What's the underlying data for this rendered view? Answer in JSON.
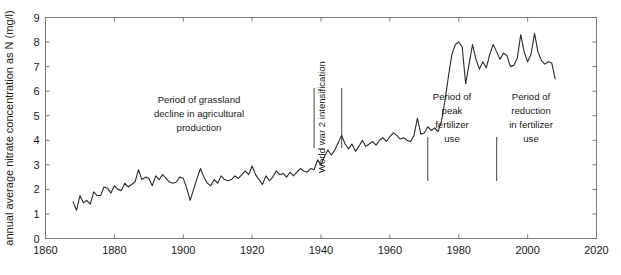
{
  "chart_data": {
    "type": "line",
    "title": "",
    "subtitle": "",
    "xlabel": "",
    "ylabel": "annual average nitrate concentration as N (mg/l)",
    "xlim": [
      1860,
      2020
    ],
    "ylim": [
      0,
      9
    ],
    "xticks": [
      1860,
      1880,
      1900,
      1920,
      1940,
      1960,
      1980,
      2000,
      2020
    ],
    "yticks": [
      0,
      1,
      2,
      3,
      4,
      5,
      6,
      7,
      8,
      9
    ],
    "grid": false,
    "legend": null,
    "series": [
      {
        "name": "annual average nitrate concentration as N",
        "x": [
          1868,
          1869,
          1870,
          1871,
          1872,
          1873,
          1874,
          1875,
          1876,
          1877,
          1878,
          1879,
          1880,
          1881,
          1882,
          1883,
          1884,
          1885,
          1886,
          1887,
          1888,
          1889,
          1890,
          1891,
          1892,
          1893,
          1894,
          1895,
          1896,
          1897,
          1898,
          1899,
          1900,
          1901,
          1902,
          1903,
          1904,
          1905,
          1906,
          1907,
          1908,
          1909,
          1910,
          1911,
          1912,
          1913,
          1914,
          1915,
          1916,
          1917,
          1918,
          1919,
          1920,
          1921,
          1922,
          1923,
          1924,
          1925,
          1926,
          1927,
          1928,
          1929,
          1930,
          1931,
          1932,
          1933,
          1934,
          1935,
          1936,
          1937,
          1938,
          1939,
          1940,
          1941,
          1942,
          1943,
          1944,
          1945,
          1946,
          1947,
          1948,
          1949,
          1950,
          1951,
          1952,
          1953,
          1954,
          1955,
          1956,
          1957,
          1958,
          1959,
          1960,
          1961,
          1962,
          1963,
          1964,
          1965,
          1966,
          1967,
          1968,
          1969,
          1970,
          1971,
          1972,
          1973,
          1974,
          1975,
          1976,
          1977,
          1978,
          1979,
          1980,
          1981,
          1982,
          1983,
          1984,
          1985,
          1986,
          1987,
          1988,
          1989,
          1990,
          1991,
          1992,
          1993,
          1994,
          1995,
          1996,
          1997,
          1998,
          1999,
          2000,
          2001,
          2002,
          2003,
          2004,
          2005,
          2006,
          2007,
          2008
        ],
        "values": [
          1.5,
          1.15,
          1.75,
          1.45,
          1.55,
          1.4,
          1.9,
          1.75,
          1.75,
          2.1,
          2.05,
          1.85,
          2.15,
          2.0,
          1.95,
          2.25,
          2.1,
          2.2,
          2.3,
          2.8,
          2.4,
          2.5,
          2.45,
          2.15,
          2.55,
          2.4,
          2.6,
          2.45,
          2.3,
          2.25,
          2.3,
          2.5,
          2.45,
          2.05,
          1.55,
          2.0,
          2.45,
          2.85,
          2.5,
          2.25,
          2.15,
          2.4,
          2.25,
          2.55,
          2.4,
          2.35,
          2.4,
          2.55,
          2.45,
          2.6,
          2.75,
          2.6,
          2.95,
          2.6,
          2.4,
          2.2,
          2.55,
          2.35,
          2.5,
          2.75,
          2.6,
          2.65,
          2.5,
          2.7,
          2.55,
          2.7,
          2.85,
          2.75,
          2.7,
          2.85,
          2.8,
          3.2,
          3.0,
          3.35,
          3.6,
          3.4,
          3.6,
          3.9,
          4.2,
          3.85,
          3.65,
          3.85,
          3.55,
          3.75,
          4.0,
          3.75,
          3.85,
          3.95,
          3.8,
          4.0,
          4.1,
          3.95,
          4.15,
          4.3,
          4.2,
          4.05,
          4.1,
          4.0,
          3.95,
          4.2,
          4.9,
          4.25,
          4.3,
          4.55,
          4.4,
          4.5,
          4.35,
          4.8,
          5.6,
          6.6,
          7.5,
          7.9,
          8.0,
          7.8,
          6.3,
          7.1,
          7.9,
          7.3,
          6.9,
          7.2,
          6.95,
          7.5,
          7.9,
          7.6,
          7.3,
          7.55,
          7.45,
          7.0,
          7.05,
          7.35,
          8.3,
          7.6,
          7.2,
          7.5,
          8.35,
          7.6,
          7.25,
          7.1,
          7.2,
          7.15,
          6.5
        ]
      }
    ],
    "annotations": [
      {
        "id": "grassland-decline",
        "lines": [
          "Period of grassland",
          "decline in agricultural",
          "production"
        ],
        "orientation": "horizontal"
      },
      {
        "id": "world-war-2",
        "lines": [
          "World war 2 intensification"
        ],
        "orientation": "vertical"
      },
      {
        "id": "peak-fertilizer",
        "lines": [
          "Period of peak",
          "fertilizer",
          "use"
        ],
        "orientation": "horizontal"
      },
      {
        "id": "reduction-fertilizer",
        "lines": [
          "Period of",
          "reduction",
          "in fertilizer",
          "use"
        ],
        "orientation": "horizontal"
      }
    ],
    "marker_lines": [
      {
        "id": "ww2-start",
        "x": 1938
      },
      {
        "id": "ww2-end",
        "x": 1946
      },
      {
        "id": "peak-fertilizer-start",
        "x": 1971
      },
      {
        "id": "reduction-start",
        "x": 1991
      }
    ],
    "colors": {
      "line": "#2b2b2b",
      "axis": "#6e6e6e",
      "text": "#1a1a1a",
      "background": "#ffffff"
    }
  },
  "labels": {
    "ylabel": "annual average nitrate concentration as N (mg/l)",
    "ytick_0": "0",
    "ytick_1": "1",
    "ytick_2": "2",
    "ytick_3": "3",
    "ytick_4": "4",
    "ytick_5": "5",
    "ytick_6": "6",
    "ytick_7": "7",
    "ytick_8": "8",
    "ytick_9": "9",
    "xtick_1860": "1860",
    "xtick_1880": "1880",
    "xtick_1900": "1900",
    "xtick_1920": "1920",
    "xtick_1940": "1940",
    "xtick_1960": "1960",
    "xtick_1980": "1980",
    "xtick_2000": "2000",
    "xtick_2020": "2020",
    "annot_grassland_l1": "Period of grassland",
    "annot_grassland_l2": "decline in agricultural",
    "annot_grassland_l3": "production",
    "annot_ww2": "World war 2 intensification",
    "annot_peak_l1": "Period of",
    "annot_peak_l2": "peak",
    "annot_peak_l3": "fertilizer",
    "annot_peak_l4": "use",
    "annot_reduction_l1": "Period of",
    "annot_reduction_l2": "reduction",
    "annot_reduction_l3": "in fertilizer",
    "annot_reduction_l4": "use"
  }
}
